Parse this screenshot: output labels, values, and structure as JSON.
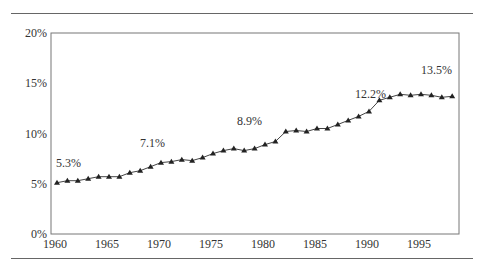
{
  "chart_data": {
    "type": "line",
    "title": "",
    "xlabel": "",
    "ylabel": "",
    "x": [
      1960,
      1961,
      1962,
      1963,
      1964,
      1965,
      1966,
      1967,
      1968,
      1969,
      1970,
      1971,
      1972,
      1973,
      1974,
      1975,
      1976,
      1977,
      1978,
      1979,
      1980,
      1981,
      1982,
      1983,
      1984,
      1985,
      1986,
      1987,
      1988,
      1989,
      1990,
      1991,
      1992,
      1993,
      1994,
      1995,
      1996,
      1997,
      1998
    ],
    "series": [
      {
        "name": "Percentage",
        "marker": "triangle",
        "values": [
          5.1,
          5.3,
          5.3,
          5.5,
          5.7,
          5.7,
          5.7,
          6.1,
          6.3,
          6.7,
          7.1,
          7.2,
          7.4,
          7.3,
          7.6,
          8.0,
          8.3,
          8.5,
          8.3,
          8.5,
          8.9,
          9.2,
          10.2,
          10.3,
          10.2,
          10.5,
          10.5,
          10.9,
          11.3,
          11.7,
          12.2,
          13.3,
          13.6,
          13.9,
          13.8,
          13.9,
          13.8,
          13.6,
          13.7
        ]
      }
    ],
    "xticks": [
      "1960",
      "1965",
      "1970",
      "1975",
      "1980",
      "1985",
      "1990",
      "1995"
    ],
    "yticks": [
      "0%",
      "5%",
      "10%",
      "15%",
      "20%"
    ],
    "xlim": [
      1960,
      1999
    ],
    "ylim": [
      0,
      20
    ],
    "grid": false,
    "legend": null,
    "annotations": [
      {
        "text": "5.3%",
        "year": 1961
      },
      {
        "text": "7.1%",
        "year": 1970
      },
      {
        "text": "8.9%",
        "year": 1980
      },
      {
        "text": "12.2%",
        "year": 1990
      },
      {
        "text": "13.5%",
        "year": 1995
      }
    ]
  }
}
